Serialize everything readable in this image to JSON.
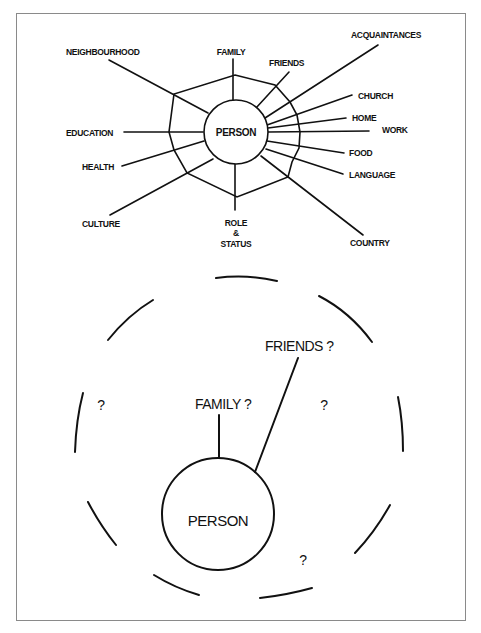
{
  "top_diagram": {
    "center_label": "PERSON",
    "spokes": [
      {
        "label": "FAMILY"
      },
      {
        "label": "FRIENDS"
      },
      {
        "label": "ACQUAINTANCES"
      },
      {
        "label": "CHURCH"
      },
      {
        "label": "HOME"
      },
      {
        "label": "WORK"
      },
      {
        "label": "FOOD"
      },
      {
        "label": "LANGUAGE"
      },
      {
        "label": "COUNTRY"
      },
      {
        "label_lines": [
          "ROLE",
          "&",
          "STATUS"
        ]
      },
      {
        "label": "CULTURE"
      },
      {
        "label": "HEALTH"
      },
      {
        "label": "EDUCATION"
      },
      {
        "label": "NEIGHBOURHOOD"
      }
    ]
  },
  "bottom_diagram": {
    "center_label": "PERSON",
    "connections": [
      {
        "label": "FAMILY ?"
      },
      {
        "label": "FRIENDS ?"
      }
    ],
    "unknowns": [
      "?",
      "?",
      "?"
    ]
  },
  "colors": {
    "line": "#111111",
    "frame": "#8a8a8a",
    "background": "#ffffff"
  }
}
